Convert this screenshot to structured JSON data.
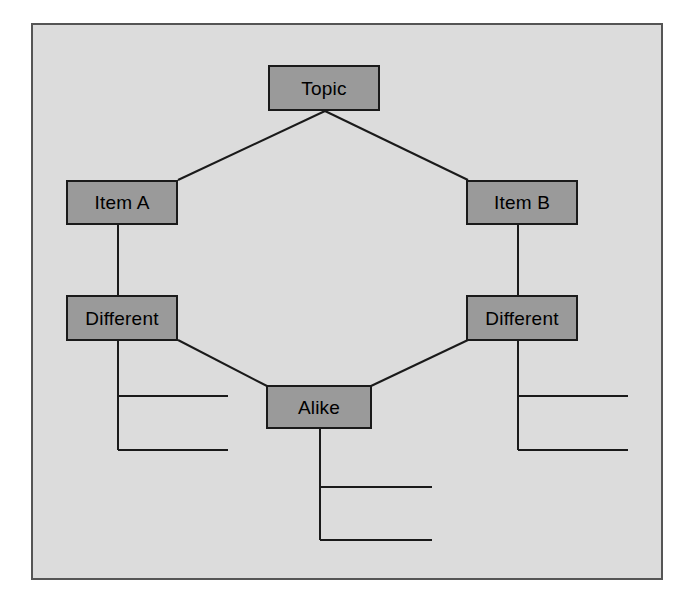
{
  "diagram": {
    "type": "compare-contrast-venn-tree",
    "frame": {
      "background_color": "#dcdcdc",
      "border_color": "#555555"
    },
    "node_style": {
      "fill_color": "#9a9a9a",
      "border_color": "#1a1a1a",
      "text_color": "#000000"
    },
    "connector_color": "#1a1a1a",
    "nodes": [
      {
        "id": "topic",
        "label": "Topic",
        "x": 268,
        "y": 65,
        "w": 112,
        "h": 46
      },
      {
        "id": "item-a",
        "label": "Item A",
        "x": 66,
        "y": 180,
        "w": 112,
        "h": 45
      },
      {
        "id": "item-b",
        "label": "Item B",
        "x": 466,
        "y": 180,
        "w": 112,
        "h": 45
      },
      {
        "id": "different-left",
        "label": "Different",
        "x": 66,
        "y": 295,
        "w": 112,
        "h": 46
      },
      {
        "id": "different-right",
        "label": "Different",
        "x": 466,
        "y": 295,
        "w": 112,
        "h": 46
      },
      {
        "id": "alike",
        "label": "Alike",
        "x": 266,
        "y": 385,
        "w": 106,
        "h": 44
      }
    ],
    "connectors": [
      {
        "from": "topic",
        "to": "item-a",
        "kind": "diagonal"
      },
      {
        "from": "topic",
        "to": "item-b",
        "kind": "diagonal"
      },
      {
        "from": "item-a",
        "to": "different-left",
        "kind": "vertical"
      },
      {
        "from": "item-b",
        "to": "different-right",
        "kind": "vertical"
      },
      {
        "from": "different-left",
        "to": "alike",
        "kind": "diagonal"
      },
      {
        "from": "different-right",
        "to": "alike",
        "kind": "diagonal"
      }
    ],
    "write_on_line_groups": [
      {
        "id": "lines-different-left",
        "under": "different-left",
        "count": 2
      },
      {
        "id": "lines-different-right",
        "under": "different-right",
        "count": 2
      },
      {
        "id": "lines-alike",
        "under": "alike",
        "count": 2
      }
    ]
  }
}
